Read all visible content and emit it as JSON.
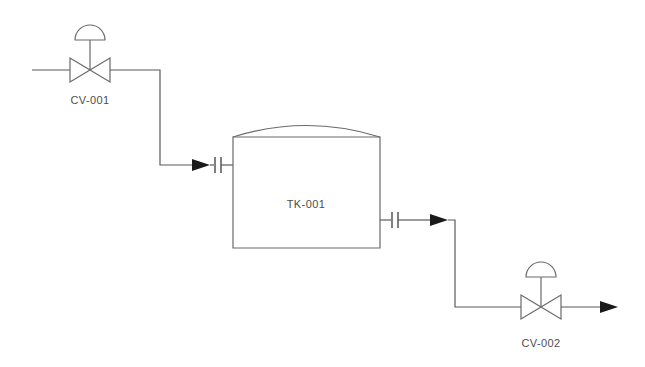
{
  "diagram": {
    "type": "process-flow-diagram",
    "title": "",
    "background_color": "#ffffff",
    "line_color": "#5a5a5a",
    "label_color": "#4d4d4d",
    "arrow_color": "#1a1a1a",
    "equipment": [
      {
        "id": "CV-001",
        "label": "CV-001",
        "kind": "control-valve",
        "actuator": "diaphragm",
        "x": 90,
        "y": 70
      },
      {
        "id": "TK-001",
        "label": "TK-001",
        "kind": "storage-tank",
        "head": "domed",
        "x": 306,
        "y": 204
      },
      {
        "id": "CV-002",
        "label": "CV-002",
        "kind": "control-valve",
        "actuator": "diaphragm",
        "x": 541,
        "y": 307
      }
    ],
    "connections": [
      {
        "id": "inlet-line",
        "from": "process-inlet",
        "to": "CV-001",
        "flow": "right"
      },
      {
        "id": "valve-to-tank-line",
        "from": "CV-001",
        "to": "TK-001",
        "flow": "right",
        "terminator": "flanged-nozzle"
      },
      {
        "id": "tank-to-valve-line",
        "from": "TK-001",
        "to": "CV-002",
        "flow": "right",
        "origin": "flanged-nozzle"
      },
      {
        "id": "outlet-line",
        "from": "CV-002",
        "to": "process-outlet",
        "flow": "right"
      }
    ]
  },
  "labels": {
    "valve_inlet": "CV-001",
    "tank": "TK-001",
    "valve_outlet": "CV-002"
  }
}
